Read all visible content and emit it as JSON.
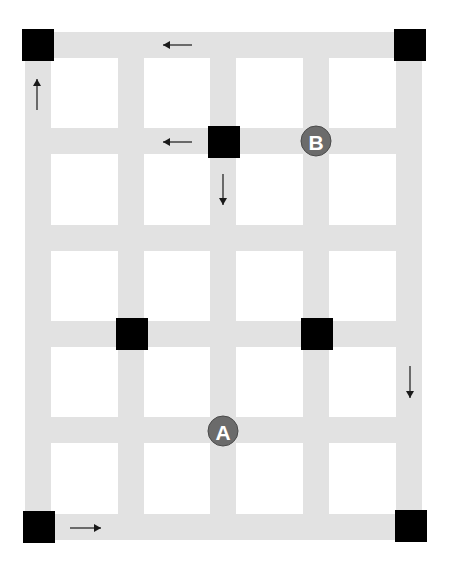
{
  "diagram": {
    "colors": {
      "background": "#ffffff",
      "road": "#e2e2e2",
      "block": "#000000",
      "marker": "#6b6b6b",
      "marker_text": "#ffffff",
      "arrow": "#1a1a1a"
    },
    "grid": {
      "road_width": 26,
      "vertical_roads_x": [
        25,
        118,
        210,
        303,
        396
      ],
      "horizontal_roads_y": [
        32,
        128,
        225,
        321,
        417,
        514
      ],
      "extent": {
        "x0": 25,
        "x1": 422,
        "y0": 32,
        "y1": 540
      }
    },
    "blocks": [
      {
        "name": "block-top-left",
        "x": 22,
        "y": 29,
        "size": 32
      },
      {
        "name": "block-top-right",
        "x": 394,
        "y": 29,
        "size": 32
      },
      {
        "name": "block-upper-middle",
        "x": 208,
        "y": 126,
        "size": 32
      },
      {
        "name": "block-mid-left",
        "x": 116,
        "y": 318,
        "size": 32
      },
      {
        "name": "block-mid-right",
        "x": 301,
        "y": 318,
        "size": 32
      },
      {
        "name": "block-bottom-left",
        "x": 23,
        "y": 511,
        "size": 32
      },
      {
        "name": "block-bottom-right",
        "x": 395,
        "y": 510,
        "size": 32
      }
    ],
    "arrows": [
      {
        "name": "arrow-left-top",
        "direction": "left",
        "x1": 192,
        "y1": 45,
        "x2": 163,
        "y2": 45
      },
      {
        "name": "arrow-up-left",
        "direction": "up",
        "x1": 37,
        "y1": 110,
        "x2": 37,
        "y2": 79
      },
      {
        "name": "arrow-left-second-row",
        "direction": "left",
        "x1": 192,
        "y1": 142,
        "x2": 163,
        "y2": 142
      },
      {
        "name": "arrow-down-center",
        "direction": "down",
        "x1": 223,
        "y1": 174,
        "x2": 223,
        "y2": 205
      },
      {
        "name": "arrow-down-right",
        "direction": "down",
        "x1": 410,
        "y1": 366,
        "x2": 410,
        "y2": 398
      },
      {
        "name": "arrow-right-bottom",
        "direction": "right",
        "x1": 70,
        "y1": 528,
        "x2": 101,
        "y2": 528
      }
    ],
    "markers": [
      {
        "name": "point-b",
        "label": "B",
        "cx": 316,
        "cy": 141,
        "r": 15
      },
      {
        "name": "point-a",
        "label": "A",
        "cx": 223,
        "cy": 431,
        "r": 15
      }
    ]
  }
}
